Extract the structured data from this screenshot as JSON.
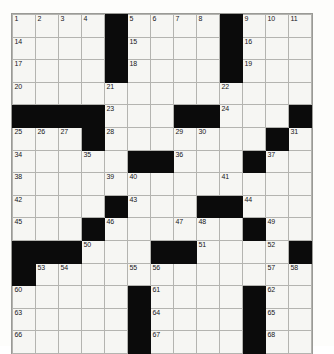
{
  "puzzle": {
    "title": "Crossword Puzzle Grid",
    "rows": 15,
    "cols": 13,
    "colors": {
      "block": "#0b0b0b",
      "cell": "#f6f6f3",
      "gridline": "#b4b4b0",
      "page": "#fdfdfb",
      "number_text": "#16161a"
    },
    "cells": [
      [
        {
          "n": "1"
        },
        {
          "n": "2"
        },
        {
          "n": "3"
        },
        {
          "n": "4"
        },
        {
          "b": true
        },
        {
          "n": "5"
        },
        {
          "n": "6"
        },
        {
          "n": "7"
        },
        {
          "n": "8"
        },
        {
          "b": true
        },
        {
          "n": "9"
        },
        {
          "n": "10"
        },
        {
          "n": "11"
        },
        {
          "n": "12"
        },
        {
          "n": "13"
        }
      ],
      [
        {
          "n": "14"
        },
        {},
        {},
        {},
        {
          "b": true
        },
        {
          "n": "15"
        },
        {},
        {},
        {},
        {
          "b": true
        },
        {
          "n": "16"
        },
        {},
        {},
        {},
        {}
      ],
      [
        {
          "n": "17"
        },
        {},
        {},
        {},
        {
          "b": true
        },
        {
          "n": "18"
        },
        {},
        {},
        {},
        {
          "b": true
        },
        {
          "n": "19"
        },
        {},
        {},
        {},
        {}
      ],
      [
        {
          "n": "20"
        },
        {},
        {},
        {},
        {
          "n": "21"
        },
        {},
        {},
        {},
        {},
        {
          "n": "22"
        },
        {},
        {},
        {},
        {
          "b": true
        },
        {}
      ],
      [
        {
          "b": true
        },
        {
          "b": true
        },
        {
          "b": true
        },
        {
          "b": true
        },
        {
          "n": "23"
        },
        {},
        {},
        {
          "b": true
        },
        {
          "b": true
        },
        {
          "n": "24"
        },
        {},
        {},
        {
          "b": true
        },
        {
          "b": true
        },
        {}
      ],
      [
        {
          "n": "25"
        },
        {
          "n": "26"
        },
        {
          "n": "27"
        },
        {
          "b": true
        },
        {
          "n": "28"
        },
        {},
        {},
        {
          "n": "29"
        },
        {
          "n": "30"
        },
        {},
        {},
        {
          "b": true
        },
        {
          "n": "31"
        },
        {
          "n": "32"
        },
        {
          "n": "33"
        }
      ],
      [
        {
          "n": "34"
        },
        {},
        {},
        {
          "n": "35"
        },
        {},
        {
          "b": true
        },
        {
          "b": true
        },
        {
          "n": "36"
        },
        {},
        {},
        {
          "b": true
        },
        {
          "n": "37"
        },
        {},
        {},
        {}
      ],
      [
        {
          "n": "38"
        },
        {},
        {},
        {},
        {
          "n": "39"
        },
        {
          "n": "40"
        },
        {},
        {},
        {},
        {
          "n": "41"
        },
        {},
        {},
        {},
        {},
        {}
      ],
      [
        {
          "n": "42"
        },
        {},
        {},
        {},
        {
          "b": true
        },
        {
          "n": "43"
        },
        {},
        {},
        {
          "b": true
        },
        {
          "b": true
        },
        {
          "n": "44"
        },
        {},
        {},
        {},
        {}
      ],
      [
        {
          "n": "45"
        },
        {},
        {},
        {
          "b": true
        },
        {
          "n": "46"
        },
        {},
        {},
        {
          "n": "47"
        },
        {
          "n": "48"
        },
        {},
        {
          "b": true
        },
        {
          "n": "49"
        },
        {},
        {},
        {}
      ],
      [
        {
          "b": true
        },
        {
          "b": true
        },
        {
          "b": true
        },
        {
          "n": "50"
        },
        {},
        {},
        {
          "b": true
        },
        {
          "b": true
        },
        {
          "n": "51"
        },
        {},
        {},
        {
          "n": "52"
        },
        {
          "b": true
        },
        {
          "b": true
        },
        {}
      ],
      [
        {
          "b": true
        },
        {
          "n": "53"
        },
        {
          "n": "54"
        },
        {},
        {},
        {
          "n": "55"
        },
        {
          "n": "56"
        },
        {},
        {},
        {},
        {},
        {
          "n": "57"
        },
        {
          "n": "58"
        },
        {
          "n": "59"
        },
        {}
      ],
      [
        {
          "n": "60"
        },
        {},
        {},
        {},
        {},
        {
          "b": true
        },
        {
          "n": "61"
        },
        {},
        {},
        {},
        {
          "b": true
        },
        {
          "n": "62"
        },
        {},
        {},
        {}
      ],
      [
        {
          "n": "63"
        },
        {},
        {},
        {},
        {},
        {
          "b": true
        },
        {
          "n": "64"
        },
        {},
        {},
        {},
        {
          "b": true
        },
        {
          "n": "65"
        },
        {},
        {},
        {}
      ],
      [
        {
          "n": "66"
        },
        {},
        {},
        {},
        {},
        {
          "b": true
        },
        {
          "n": "67"
        },
        {},
        {},
        {},
        {
          "b": true
        },
        {
          "n": "68"
        },
        {},
        {},
        {}
      ]
    ],
    "clue_numbers": [
      "1",
      "2",
      "3",
      "4",
      "5",
      "6",
      "7",
      "8",
      "9",
      "10",
      "11",
      "12",
      "13",
      "14",
      "15",
      "16",
      "17",
      "18",
      "19",
      "20",
      "21",
      "22",
      "23",
      "24",
      "25",
      "26",
      "27",
      "28",
      "29",
      "30",
      "31",
      "32",
      "33",
      "34",
      "35",
      "36",
      "37",
      "38",
      "39",
      "40",
      "41",
      "42",
      "43",
      "44",
      "45",
      "46",
      "47",
      "48",
      "49",
      "50",
      "51",
      "52",
      "53",
      "54",
      "55",
      "56",
      "57",
      "58",
      "59",
      "60",
      "61",
      "62",
      "63",
      "64",
      "65",
      "66",
      "67",
      "68"
    ]
  }
}
